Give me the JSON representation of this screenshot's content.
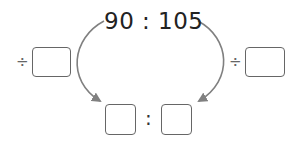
{
  "ratio": {
    "left_value": "90",
    "separator": ":",
    "right_value": "105"
  },
  "operations": {
    "left_operator": "÷",
    "right_operator": "÷",
    "left_divisor_input": "",
    "right_divisor_input": ""
  },
  "result": {
    "left_input": "",
    "separator": ":",
    "right_input": ""
  },
  "colors": {
    "arrow": "#808080",
    "box_border": "#666666",
    "text": "#222222"
  }
}
